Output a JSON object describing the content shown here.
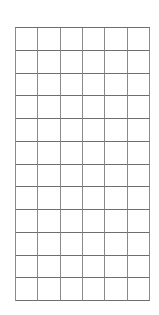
{
  "grid": {
    "columns": 6,
    "rows": 12,
    "line_color": "#777777",
    "background": "#ffffff"
  }
}
